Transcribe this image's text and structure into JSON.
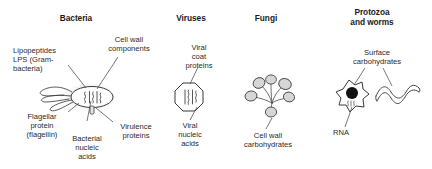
{
  "figure": {
    "title_columns": [
      {
        "id": "bacteria",
        "label": "Bacteria"
      },
      {
        "id": "viruses",
        "label": "Viruses"
      },
      {
        "id": "fungi",
        "label": "Fungi"
      },
      {
        "id": "protozoa",
        "label": "Protozoa\nand worms"
      }
    ],
    "background_color": "#ffffff",
    "line_color": "#3a3a3a",
    "text_color": "#2a2a2a",
    "fill_color": "#d9d9d9",
    "nucleus_color": "#111111"
  },
  "bacteria": {
    "labels": {
      "lipopeptides": "Lipopeptides\nLPS (Gram-\nbacteria)",
      "cell_wall": "Cell wall\ncomponents",
      "flagellar": "Flagellar\nprotein\n(flagellin)",
      "nucleic": "Bacterial\nnucleic\nacids",
      "virulence": "Virulence\nproteins"
    }
  },
  "viruses": {
    "labels": {
      "coat": "Viral\ncoat\nproteins",
      "nucleic": "Viral\nnucleic\nacids"
    }
  },
  "fungi": {
    "labels": {
      "cell_wall_carbs": "Cell wall\ncarbohydrates"
    }
  },
  "protozoa": {
    "labels": {
      "surface_carbs": "Surface\ncarbohydrates",
      "rna": "RNA"
    }
  }
}
